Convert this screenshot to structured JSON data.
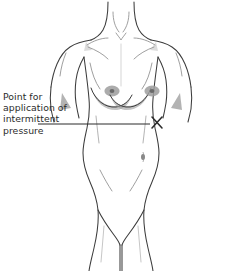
{
  "figure": {
    "background_color": "#ffffff",
    "outline_color": "#3c3c3c",
    "detail_color": "#8a8a8a",
    "shading_color": "#9a9a9a",
    "areola_color": "#a0a0a0",
    "nipple_color": "#6e6e6e",
    "annotation_color": "#2b2b2b"
  },
  "annotation": {
    "label_lines": [
      "Point for",
      "application of",
      "intermittent",
      "pressure"
    ],
    "label_text": "Point for\napplication of\nintermittent\npressure",
    "marker_symbol": "X",
    "marker_label": "pressure-point-marker",
    "leader_line": {
      "x1": 38,
      "y1": 124,
      "x2": 150,
      "y2": 124
    },
    "marker_position": {
      "x": 157,
      "y": 123
    }
  },
  "parts": [
    {
      "name": "neck",
      "label": "Neck"
    },
    {
      "name": "clavicle-left",
      "label": "Left clavicle"
    },
    {
      "name": "clavicle-right",
      "label": "Right clavicle"
    },
    {
      "name": "shoulder-left",
      "label": "Left shoulder"
    },
    {
      "name": "shoulder-right",
      "label": "Right shoulder"
    },
    {
      "name": "breast-left",
      "label": "Left breast"
    },
    {
      "name": "breast-right",
      "label": "Right breast"
    },
    {
      "name": "rib-cage",
      "label": "Rib cage"
    },
    {
      "name": "navel",
      "label": "Navel"
    },
    {
      "name": "abdomen",
      "label": "Abdomen"
    },
    {
      "name": "groin",
      "label": "Groin"
    }
  ],
  "bottom_edge": {
    "cropped_text": " "
  }
}
